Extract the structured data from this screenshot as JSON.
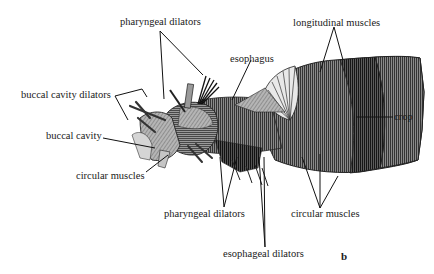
{
  "figure": {
    "panel_letter": "b",
    "labels": {
      "pharyngeal_dilators_top": "pharyngeal dilators",
      "longitudinal_muscles": "longitudinal muscles",
      "esophagus": "esophagus",
      "buccal_cavity_dilators": "buccal cavity dilators",
      "crop": "crop",
      "buccal_cavity": "buccal cavity",
      "circular_muscles_left": "circular muscles",
      "pharyngeal_dilators_bottom": "pharyngeal dilators",
      "circular_muscles_right": "circular muscles",
      "esophageal_dilators": "esophageal dilators"
    },
    "colors": {
      "ink": "#1a1a1a",
      "shade_dark": "#3a3a3a",
      "shade_mid": "#6e6e6e",
      "shade_light": "#a8a8a8",
      "background": "#ffffff"
    }
  }
}
